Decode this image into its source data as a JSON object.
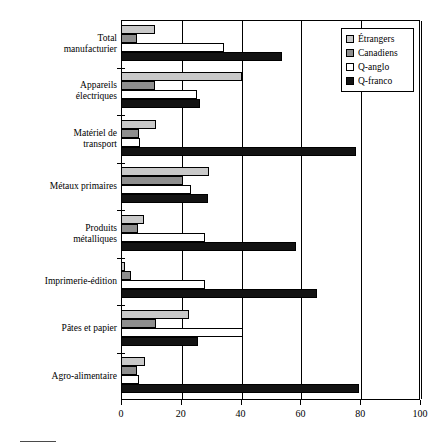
{
  "chart_data": {
    "type": "bar",
    "orientation": "horizontal",
    "title": "",
    "subtitle": "",
    "xlabel": "",
    "ylabel": "",
    "xlim": [
      0,
      100
    ],
    "xticks": [
      0,
      20,
      40,
      60,
      80,
      100
    ],
    "xtick_labels": [
      "0",
      "20",
      "40",
      "60",
      "80",
      "100"
    ],
    "grid": true,
    "legend_position": "top-right",
    "categories": [
      "Total manufacturier",
      "Appareils électriques",
      "Matériel de transport",
      "Métaux primaires",
      "Produits métalliques",
      "Imprimerie-édition",
      "Pâtes et papier",
      "Agro-alimentaire"
    ],
    "category_lines": [
      [
        "Total",
        "manufacturier"
      ],
      [
        "Appareils",
        "électriques"
      ],
      [
        "Matériel de",
        "transport"
      ],
      [
        "Métaux primaires"
      ],
      [
        "Produits",
        "métalliques"
      ],
      [
        "Imprimerie-édition"
      ],
      [
        "Pâtes et papier"
      ],
      [
        "Agro-alimentaire"
      ]
    ],
    "series": [
      {
        "name": "Étrangers",
        "color": "#c9c9c9",
        "values": [
          11.4,
          40.4,
          11.6,
          29.3,
          7.8,
          1.5,
          22.8,
          8.0
        ]
      },
      {
        "name": "Canadiens",
        "color": "#8e8e8e",
        "values": [
          5.2,
          11.4,
          5.9,
          20.6,
          5.7,
          3.3,
          11.6,
          5.2
        ]
      },
      {
        "name": "Q-anglo",
        "color": "#ffffff",
        "values": [
          34.4,
          25.4,
          6.5,
          23.5,
          28.0,
          28.0,
          40.8,
          6.0
        ]
      },
      {
        "name": "Q-franco",
        "color": "#131313",
        "values": [
          54.0,
          26.3,
          78.7,
          29.1,
          58.6,
          65.5,
          25.7,
          79.5
        ]
      }
    ]
  },
  "legend": {
    "items": [
      {
        "label": "Étrangers",
        "swatch": "series-0-swatch"
      },
      {
        "label": "Canadiens",
        "swatch": "series-1-swatch"
      },
      {
        "label": "Q-anglo",
        "swatch": "series-2-swatch"
      },
      {
        "label": "Q-franco",
        "swatch": "series-3-swatch"
      }
    ]
  }
}
